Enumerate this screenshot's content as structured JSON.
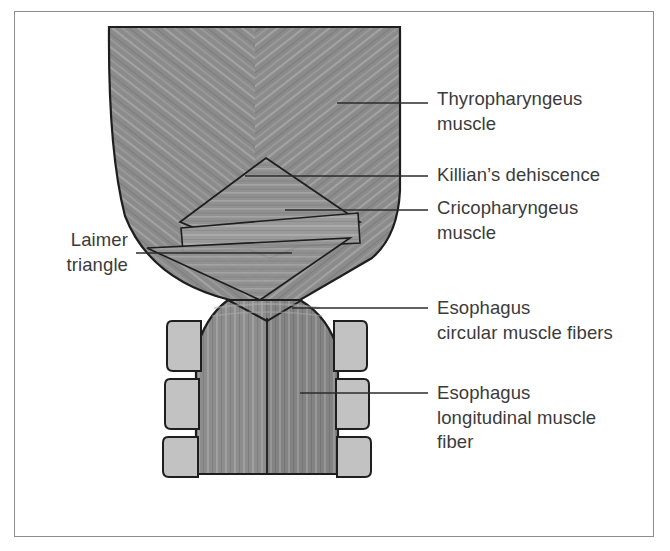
{
  "figure": {
    "frame": {
      "border_color": "#8d8d8d",
      "background": "#ffffff"
    },
    "palette": {
      "muscle_dark": "#8a8a8a",
      "muscle_mid": "#949494",
      "muscle_light": "#a0a0a0",
      "cricopharyngeus_fill": "#9a9a9a",
      "killian_fill": "#8f8f8f",
      "cartilage_fill": "#c2c2c2",
      "outline": "#1e1e1e",
      "leader_line": "#2b2b2b",
      "text": "#3b3b3b"
    }
  },
  "labels": [
    {
      "id": "thyropharyngeus-muscle",
      "text": "Thyropharyngeus\nmuscle",
      "side": "right",
      "x": 437,
      "y": 87,
      "leader": {
        "x1": 337,
        "y1": 103,
        "x2": 428,
        "y2": 103
      }
    },
    {
      "id": "killians-dehiscence",
      "text": "Killian’s dehiscence",
      "side": "right",
      "x": 437,
      "y": 163,
      "leader": {
        "x1": 245,
        "y1": 176,
        "x2": 428,
        "y2": 176
      }
    },
    {
      "id": "cricopharyngeus-muscle",
      "text": "Cricopharyngeus\nmuscle",
      "side": "right",
      "x": 437,
      "y": 196,
      "leader": {
        "x1": 285,
        "y1": 210,
        "x2": 428,
        "y2": 210
      }
    },
    {
      "id": "laimer-triangle",
      "text": "Laimer\ntriangle",
      "side": "left",
      "x": 36,
      "y": 228,
      "w": 92,
      "leader": {
        "x1": 136,
        "y1": 253,
        "x2": 292,
        "y2": 253
      }
    },
    {
      "id": "esophagus-circular-muscle-fibers",
      "text": "Esophagus\ncircular muscle fibers",
      "side": "right",
      "x": 437,
      "y": 296,
      "leader": {
        "x1": 292,
        "y1": 308,
        "x2": 428,
        "y2": 308
      }
    },
    {
      "id": "esophagus-longitudinal-muscle-fiber",
      "text": "Esophagus\nlongitudinal muscle\nfiber",
      "side": "right",
      "x": 437,
      "y": 381,
      "leader": {
        "x1": 300,
        "y1": 393,
        "x2": 428,
        "y2": 393
      }
    }
  ],
  "anatomy": {
    "structures": [
      {
        "name": "thyropharyngeus-muscle",
        "description": "oblique chevron fibers, upper pharyngeal constrictor"
      },
      {
        "name": "killians-dehiscence",
        "description": "upper triangular gap between thyropharyngeus and cricopharyngeus"
      },
      {
        "name": "cricopharyngeus-muscle",
        "description": "transverse horizontal fiber band"
      },
      {
        "name": "laimer-triangle",
        "description": "lower inverted triangle below cricopharyngeus"
      },
      {
        "name": "esophagus-circular-muscle-fibers",
        "description": "circular layer of esophageal wall"
      },
      {
        "name": "esophagus-longitudinal-muscle-fiber",
        "description": "longitudinal layer descending to esophagus"
      },
      {
        "name": "cartilage-blocks",
        "description": "three paired lateral cartilage/vertebral blocks on each side"
      }
    ]
  }
}
